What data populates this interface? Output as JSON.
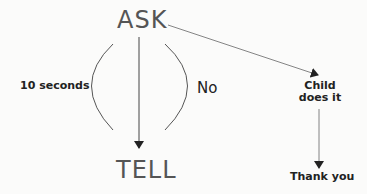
{
  "nodes": {
    "ask": "ASK",
    "tell": "TELL",
    "child_line1": "Child",
    "child_line2": "does it",
    "thank_you": "Thank you"
  },
  "edge_labels": {
    "left_arc": "10 seconds",
    "right_arc": "No"
  },
  "colors": {
    "background": "#fbfbfa",
    "line": "#444444",
    "big_text": "#555555"
  }
}
